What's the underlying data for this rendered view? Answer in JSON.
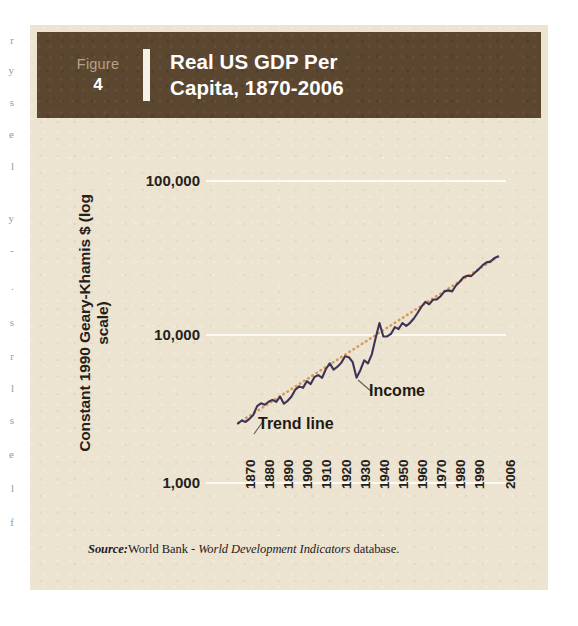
{
  "header": {
    "figure_word": "Figure",
    "figure_number": "4",
    "title": "Real US GDP Per\nCapita, 1870-2006"
  },
  "source_note": {
    "prefix": "Source:",
    "publisher": "World Bank - ",
    "italic_title": "World Development Indicators",
    "suffix": " database."
  },
  "colors": {
    "panel_background": "#ece4d1",
    "header_band": "#5b462f",
    "header_text": "#ffffff",
    "figure_word": "#b7a283",
    "gridline": "#fcfaf2",
    "income_line": "#3d3356",
    "trend_line": "#d89a5a",
    "axis_text": "#26201a"
  },
  "chart_data": {
    "type": "line",
    "title": "Real US GDP Per Capita, 1870-2006",
    "xlabel": "",
    "ylabel": "Constant 1990 Geary-Khamis $ (log scale)",
    "yscale": "log",
    "ylim": [
      1000,
      100000
    ],
    "xlim": [
      1870,
      2006
    ],
    "grid": true,
    "legend": "annotations-inline",
    "y_tick_labels": [
      "100,000",
      "10,000",
      "1,000"
    ],
    "y_tick_values": [
      100000,
      10000,
      1000
    ],
    "x_tick_labels": [
      "1870",
      "1880",
      "1890",
      "1900",
      "1910",
      "1920",
      "1930",
      "1940",
      "1950",
      "1960",
      "1970",
      "1980",
      "1990",
      "2006"
    ],
    "x_tick_values": [
      1870,
      1880,
      1890,
      1900,
      1910,
      1920,
      1930,
      1940,
      1950,
      1960,
      1970,
      1980,
      1990,
      2006
    ],
    "annotations": [
      {
        "name": "trend-line",
        "label": "Trend line"
      },
      {
        "name": "income",
        "label": "Income"
      }
    ],
    "series": [
      {
        "name": "Income",
        "color": "#3d3356",
        "style": "solid",
        "x": [
          1870,
          1872,
          1874,
          1876,
          1878,
          1880,
          1882,
          1884,
          1886,
          1888,
          1890,
          1892,
          1894,
          1896,
          1898,
          1900,
          1902,
          1904,
          1906,
          1908,
          1910,
          1912,
          1914,
          1916,
          1918,
          1920,
          1922,
          1924,
          1926,
          1928,
          1930,
          1932,
          1934,
          1936,
          1938,
          1940,
          1942,
          1944,
          1946,
          1948,
          1950,
          1952,
          1954,
          1956,
          1958,
          1960,
          1962,
          1964,
          1966,
          1968,
          1970,
          1972,
          1974,
          1976,
          1978,
          1980,
          1982,
          1984,
          1986,
          1988,
          1990,
          1992,
          1994,
          1996,
          1998,
          2000,
          2002,
          2004,
          2006
        ],
        "values": [
          2445,
          2555,
          2500,
          2620,
          2780,
          3184,
          3320,
          3250,
          3400,
          3500,
          3392,
          3680,
          3300,
          3450,
          3680,
          4091,
          4300,
          4200,
          4650,
          4450,
          4964,
          5100,
          4900,
          5600,
          6100,
          5552,
          5800,
          6150,
          6800,
          6700,
          6213,
          4908,
          5500,
          6400,
          6100,
          7010,
          9000,
          11300,
          9200,
          9200,
          9561,
          10600,
          10300,
          11300,
          10800,
          11328,
          12100,
          13200,
          14500,
          15600,
          15030,
          16100,
          16200,
          17000,
          18300,
          18577,
          18300,
          20000,
          21200,
          22700,
          23201,
          23100,
          24400,
          25700,
          27300,
          28467,
          28800,
          30300,
          31178
        ]
      },
      {
        "name": "Trend line",
        "color": "#d89a5a",
        "style": "dotted",
        "x": [
          1870,
          2006
        ],
        "values": [
          2450,
          31000
        ],
        "description": "Exponential trend fitted through income, appears as straight dotted line on log scale"
      }
    ]
  }
}
